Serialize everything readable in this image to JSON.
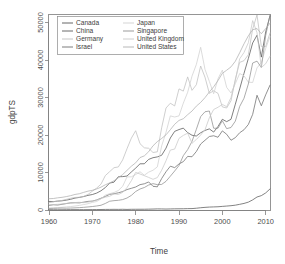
{
  "chart_data": {
    "type": "line",
    "title": "",
    "xlabel": "Time",
    "ylabel": "gdpTS",
    "xlim": [
      1960,
      2011
    ],
    "ylim": [
      0,
      52000
    ],
    "xticks": [
      1960,
      1970,
      1980,
      1990,
      2000,
      2010
    ],
    "xticklabels": [
      "1960",
      "1970",
      "1980",
      "1990",
      "2000",
      "2010"
    ],
    "yticks": [
      0,
      10000,
      20000,
      30000,
      40000,
      50000
    ],
    "yticklabels": [
      "0",
      "10000",
      "20000",
      "30000",
      "40000",
      "50000"
    ],
    "grid": false,
    "legend_position": "top-left",
    "legend_columns": 2,
    "x": [
      1960,
      1961,
      1962,
      1963,
      1964,
      1965,
      1966,
      1967,
      1968,
      1969,
      1970,
      1971,
      1972,
      1973,
      1974,
      1975,
      1976,
      1977,
      1978,
      1979,
      1980,
      1981,
      1982,
      1983,
      1984,
      1985,
      1986,
      1987,
      1988,
      1989,
      1990,
      1991,
      1992,
      1993,
      1994,
      1995,
      1996,
      1997,
      1998,
      1999,
      2000,
      2001,
      2002,
      2003,
      2004,
      2005,
      2006,
      2007,
      2008,
      2009,
      2010,
      2011
    ],
    "series": [
      {
        "name": "Canada",
        "color": "#555555",
        "values": [
          2294,
          2232,
          2365,
          2455,
          2629,
          2862,
          3182,
          3352,
          3585,
          3907,
          4122,
          4510,
          5125,
          5987,
          7187,
          7425,
          8870,
          8902,
          9052,
          10136,
          11171,
          12317,
          12329,
          13498,
          13944,
          14161,
          14596,
          16496,
          19199,
          20970,
          21450,
          21830,
          20638,
          19935,
          19727,
          20597,
          21220,
          21629,
          20779,
          22268,
          24189,
          23561,
          24186,
          28217,
          32272,
          36444,
          40386,
          44544,
          46594,
          40773,
          47465,
          51791
        ]
      },
      {
        "name": "China",
        "color": "#5a5a5a",
        "values": [
          89,
          73,
          70,
          74,
          85,
          98,
          104,
          96,
          91,
          100,
          113,
          118,
          131,
          157,
          160,
          178,
          165,
          185,
          156,
          183,
          195,
          197,
          203,
          225,
          251,
          294,
          282,
          252,
          284,
          311,
          317,
          333,
          366,
          377,
          473,
          604,
          703,
          781,
          821,
          865,
          959,
          1053,
          1148,
          1288,
          1508,
          1753,
          2099,
          2693,
          3468,
          3832,
          4550,
          5618
        ]
      },
      {
        "name": "Germany",
        "color": "#bfbfbf",
        "values": [
          1950,
          2180,
          2400,
          2550,
          2840,
          3130,
          3350,
          3400,
          3620,
          4150,
          5020,
          5840,
          6900,
          9180,
          10230,
          11280,
          11480,
          13360,
          16340,
          19150,
          21140,
          17680,
          16580,
          16460,
          15330,
          15520,
          21940,
          27200,
          28470,
          27750,
          32300,
          31700,
          35500,
          31900,
          33400,
          38400,
          35400,
          31100,
          31800,
          31100,
          27500,
          27200,
          29130,
          34900,
          39360,
          39830,
          41400,
          48300,
          52000,
          43600,
          43600,
          47200
        ]
      },
      {
        "name": "Israel",
        "color": "#6e6e6e",
        "values": [
          1229,
          1402,
          1333,
          1518,
          1721,
          1895,
          1935,
          1901,
          2085,
          2300,
          2370,
          2680,
          3140,
          3630,
          4180,
          4340,
          4580,
          4910,
          5450,
          5780,
          6130,
          6760,
          6990,
          7480,
          6320,
          6180,
          8400,
          10200,
          11680,
          11300,
          12280,
          12900,
          14300,
          14200,
          15600,
          17600,
          18600,
          19600,
          19800,
          19400,
          21100,
          20200,
          18600,
          19300,
          20600,
          21400,
          22800,
          25500,
          30600,
          27800,
          30700,
          33300
        ]
      },
      {
        "name": "Japan",
        "color": "#d0d0d0",
        "values": [
          479,
          564,
          634,
          718,
          836,
          920,
          1060,
          1230,
          1450,
          1670,
          2030,
          2270,
          2970,
          3970,
          4350,
          4660,
          5200,
          6330,
          8830,
          8840,
          9460,
          10200,
          9280,
          10100,
          10600,
          11500,
          17100,
          20700,
          25100,
          24800,
          25100,
          28500,
          31400,
          35700,
          38800,
          43400,
          37500,
          34300,
          31000,
          35000,
          37300,
          32700,
          31200,
          33700,
          36400,
          35800,
          34100,
          34000,
          37900,
          39300,
          43100,
          46200
        ]
      },
      {
        "name": "Singapore",
        "color": "#909090",
        "values": [
          428,
          449,
          472,
          512,
          485,
          517,
          570,
          627,
          708,
          813,
          926,
          1072,
          1265,
          1745,
          2339,
          2493,
          2586,
          2778,
          3194,
          3900,
          4928,
          5598,
          6000,
          6662,
          7028,
          6762,
          6824,
          7646,
          9014,
          10400,
          11862,
          14500,
          16100,
          18300,
          21500,
          24900,
          26200,
          26400,
          21800,
          21800,
          23800,
          21700,
          22000,
          23700,
          27600,
          29800,
          33600,
          39200,
          39700,
          38000,
          46500,
          53100
        ]
      },
      {
        "name": "United Kingdom",
        "color": "#c8c8c8",
        "values": [
          1380,
          1452,
          1513,
          1601,
          1748,
          1873,
          1986,
          2059,
          1952,
          2100,
          2348,
          2650,
          3030,
          3426,
          3665,
          4300,
          4140,
          4700,
          5976,
          7810,
          10032,
          9600,
          9146,
          8690,
          8180,
          8652,
          10611,
          13118,
          15988,
          16240,
          19095,
          19900,
          20490,
          17800,
          18800,
          20000,
          21400,
          24600,
          26800,
          27400,
          28150,
          27550,
          30000,
          34500,
          40300,
          42000,
          44600,
          50500,
          47300,
          38000,
          39000,
          41000
        ]
      },
      {
        "name": "United States",
        "color": "#b0b0b0",
        "values": [
          3007,
          3067,
          3244,
          3375,
          3574,
          3828,
          4146,
          4336,
          4696,
          5032,
          5247,
          5609,
          6094,
          6726,
          7226,
          7801,
          8592,
          9453,
          10565,
          11674,
          12575,
          13976,
          14434,
          15544,
          17121,
          18237,
          19071,
          20039,
          21417,
          22857,
          23889,
          24342,
          25419,
          26387,
          27695,
          28691,
          29968,
          31459,
          32854,
          34515,
          36450,
          37274,
          38166,
          39677,
          41922,
          44308,
          46437,
          48062,
          48401,
          47002,
          48374,
          49791
        ]
      }
    ]
  },
  "axes": {
    "x_title": "Time",
    "y_title": "gdpTS"
  },
  "legend": {
    "entries": [
      {
        "label": "Canada",
        "color": "#555555"
      },
      {
        "label": "Japan",
        "color": "#d0d0d0"
      },
      {
        "label": "China",
        "color": "#5a5a5a"
      },
      {
        "label": "Singapore",
        "color": "#909090"
      },
      {
        "label": "Germany",
        "color": "#bfbfbf"
      },
      {
        "label": "United Kingdom",
        "color": "#c8c8c8"
      },
      {
        "label": "Israel",
        "color": "#6e6e6e"
      },
      {
        "label": "United States",
        "color": "#b0b0b0"
      }
    ]
  }
}
